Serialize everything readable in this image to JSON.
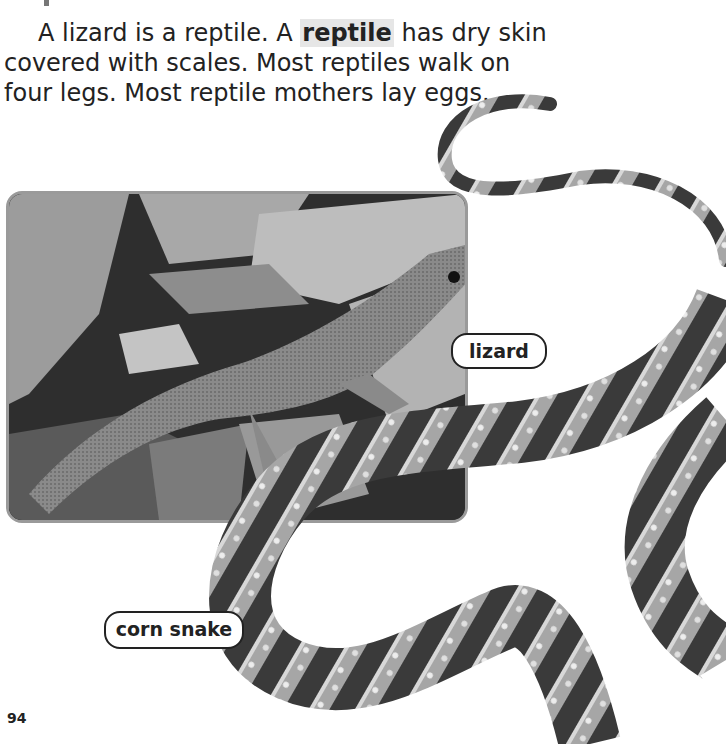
{
  "page": {
    "paragraph": {
      "before_term": "A lizard is a reptile. A ",
      "term": "reptile",
      "after_term": " has dry skin covered with scales. Most reptiles walk on four legs. Most reptile mothers lay eggs."
    },
    "labels": {
      "lizard": "lizard",
      "corn_snake": "corn snake"
    },
    "page_number": "94"
  },
  "colors": {
    "term_highlight": "#e6e6e6",
    "photo_border": "#9a9a9a",
    "label_border": "#222222"
  },
  "images": {
    "lizard_photo": "lizard-on-dry-leaves",
    "snake_photo": "corn-snake"
  }
}
